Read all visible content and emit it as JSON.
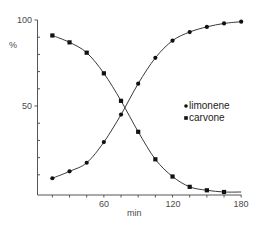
{
  "chart_data": {
    "type": "line",
    "title": "",
    "xlabel": "min",
    "ylabel": "%",
    "xlim": [
      0,
      180
    ],
    "ylim": [
      0,
      100
    ],
    "x_ticks": [
      60,
      120,
      180
    ],
    "x_minor_tick_step": 15,
    "y_ticks": [
      50,
      100
    ],
    "y_minor_tick_step": 10,
    "grid": false,
    "legend_position": "right-middle",
    "series": [
      {
        "name": "limonene",
        "marker": "circle",
        "x": [
          15,
          30,
          45,
          60,
          75,
          90,
          105,
          120,
          135,
          150,
          165,
          180
        ],
        "values": [
          8,
          12,
          17,
          29,
          45,
          63,
          78,
          88,
          93,
          96,
          98,
          99
        ]
      },
      {
        "name": "carvone",
        "marker": "square",
        "x": [
          15,
          30,
          45,
          60,
          75,
          90,
          105,
          120,
          135,
          150,
          165
        ],
        "values": [
          91,
          87,
          81,
          69,
          53,
          35,
          19,
          9,
          3,
          1,
          0
        ]
      }
    ]
  },
  "axes": {
    "x_label": "min",
    "y_label": "%",
    "x_tick_labels": [
      "60",
      "120",
      "180"
    ],
    "y_tick_labels": [
      "50",
      "100"
    ]
  },
  "legend": {
    "items": [
      {
        "label": "limonene",
        "marker": "circle"
      },
      {
        "label": "carvone",
        "marker": "square"
      }
    ]
  },
  "colors": {
    "line": "#3a3a3a",
    "marker": "#111111",
    "axis": "#555555",
    "text": "#4a4a4a"
  }
}
